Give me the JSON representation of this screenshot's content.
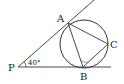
{
  "diagram": {
    "type": "geometry",
    "points": {
      "P": {
        "label": "P",
        "x": 18,
        "y": 67
      },
      "A": {
        "label": "A",
        "x": 68,
        "y": 23
      },
      "B": {
        "label": "B",
        "x": 83,
        "y": 67
      },
      "C": {
        "label": "C",
        "x": 108,
        "y": 44
      }
    },
    "circle": {
      "cx": 84,
      "cy": 44,
      "r": 24
    },
    "angle_P": {
      "label": "40°",
      "value": 40
    },
    "line_color": "#333333"
  }
}
